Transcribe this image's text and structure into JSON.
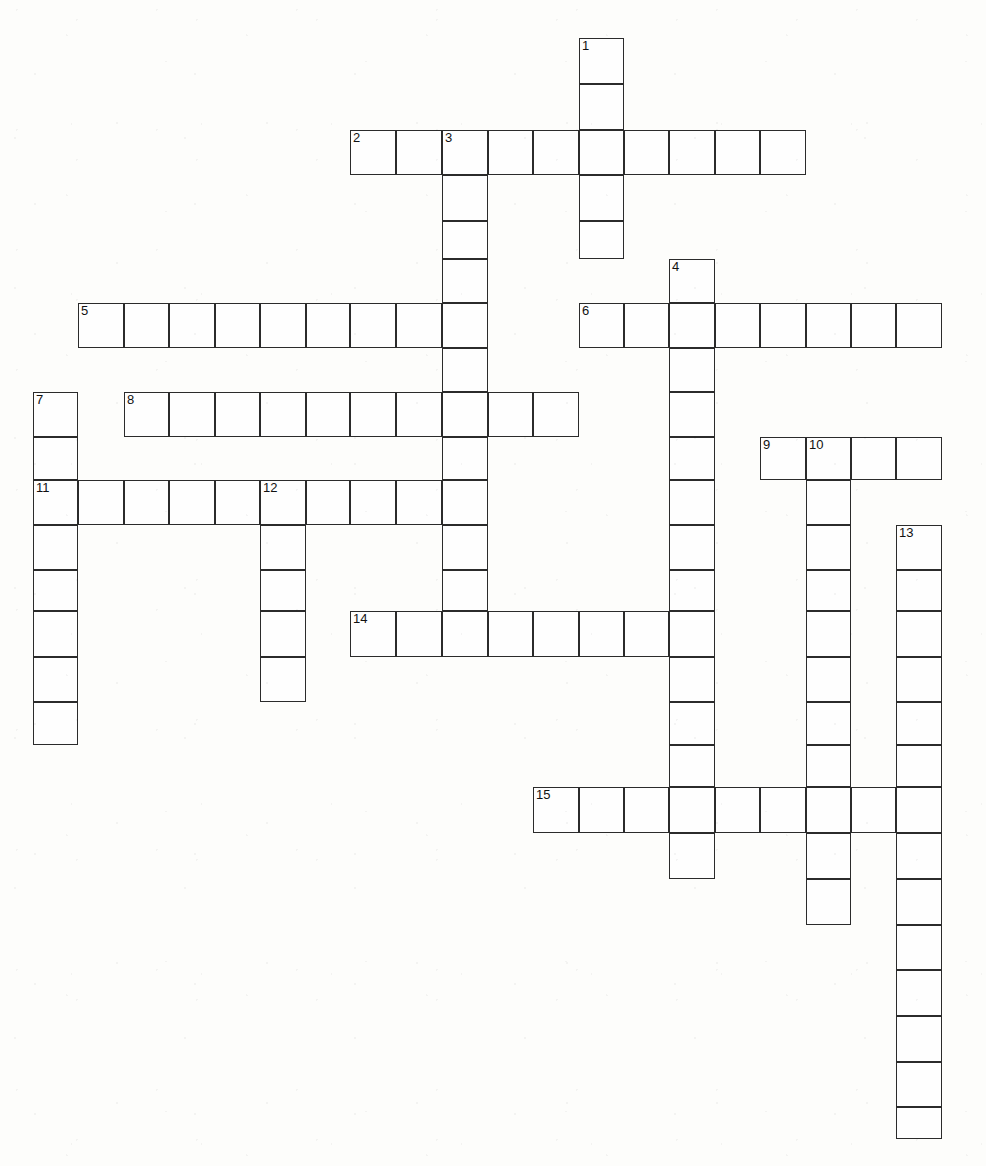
{
  "puzzle": {
    "type": "crossword-grid",
    "title": "",
    "width": 986,
    "height": 1166,
    "cell_size": 45.5,
    "grid_colors": {
      "cell_fill": "#fefefe",
      "cell_border": "#2b2b2b",
      "page_background": "#fdfdfb",
      "number_color": "#111111"
    },
    "origin": {
      "x": 33,
      "y": 38
    },
    "columns_px": [
      33,
      78,
      124,
      169,
      215,
      260,
      306,
      350,
      396,
      442,
      488,
      533,
      579,
      624,
      669,
      715,
      760,
      806,
      851,
      896,
      942
    ],
    "rows_px": [
      38,
      84,
      130,
      175,
      221,
      259,
      303,
      348,
      392,
      437,
      480,
      525,
      570,
      611,
      657,
      702,
      745,
      787,
      833,
      879,
      925,
      970,
      1016,
      1062,
      1107,
      1139
    ],
    "entries": [
      {
        "number": "1",
        "direction": "down",
        "start_col": 12,
        "start_row": 0,
        "length": 5,
        "label": "1-down"
      },
      {
        "number": "2",
        "direction": "across",
        "start_col": 7,
        "start_row": 2,
        "length": 10,
        "label": "2-across"
      },
      {
        "number": "3",
        "direction": "down",
        "start_col": 9,
        "start_row": 2,
        "length": 12,
        "label": "3-down"
      },
      {
        "number": "4",
        "direction": "down",
        "start_col": 14,
        "start_row": 5,
        "length": 14,
        "label": "4-down"
      },
      {
        "number": "5",
        "direction": "across",
        "start_col": 1,
        "start_row": 6,
        "length": 9,
        "label": "5-across"
      },
      {
        "number": "6",
        "direction": "across",
        "start_col": 12,
        "start_row": 6,
        "length": 8,
        "label": "6-across"
      },
      {
        "number": "7",
        "direction": "down",
        "start_col": 0,
        "start_row": 8,
        "length": 8,
        "label": "7-down"
      },
      {
        "number": "8",
        "direction": "across",
        "start_col": 2,
        "start_row": 8,
        "length": 10,
        "label": "8-across"
      },
      {
        "number": "9",
        "direction": "across",
        "start_col": 16,
        "start_row": 9,
        "length": 4,
        "label": "9-across"
      },
      {
        "number": "10",
        "direction": "down",
        "start_col": 17,
        "start_row": 9,
        "length": 11,
        "label": "10-down"
      },
      {
        "number": "11",
        "direction": "across",
        "start_col": 0,
        "start_row": 10,
        "length": 10,
        "label": "11-across"
      },
      {
        "number": "12",
        "direction": "down",
        "start_col": 5,
        "start_row": 10,
        "length": 5,
        "label": "12-down"
      },
      {
        "number": "13",
        "direction": "down",
        "start_col": 19,
        "start_row": 11,
        "length": 14,
        "label": "13-down"
      },
      {
        "number": "14",
        "direction": "across",
        "start_col": 7,
        "start_row": 13,
        "length": 8,
        "label": "14-across"
      },
      {
        "number": "15",
        "direction": "across",
        "start_col": 11,
        "start_row": 17,
        "length": 9,
        "label": "15-across"
      }
    ],
    "numbered_cells": [
      {
        "number": "1",
        "col": 12,
        "row": 0
      },
      {
        "number": "2",
        "col": 7,
        "row": 2
      },
      {
        "number": "3",
        "col": 9,
        "row": 2
      },
      {
        "number": "4",
        "col": 14,
        "row": 5
      },
      {
        "number": "5",
        "col": 1,
        "row": 6
      },
      {
        "number": "6",
        "col": 12,
        "row": 6
      },
      {
        "number": "7",
        "col": 0,
        "row": 8
      },
      {
        "number": "8",
        "col": 2,
        "row": 8
      },
      {
        "number": "9",
        "col": 16,
        "row": 9
      },
      {
        "number": "10",
        "col": 17,
        "row": 9
      },
      {
        "number": "11",
        "col": 0,
        "row": 10
      },
      {
        "number": "12",
        "col": 5,
        "row": 10
      },
      {
        "number": "13",
        "col": 19,
        "row": 11
      },
      {
        "number": "14",
        "col": 7,
        "row": 13
      },
      {
        "number": "15",
        "col": 11,
        "row": 17
      }
    ]
  }
}
